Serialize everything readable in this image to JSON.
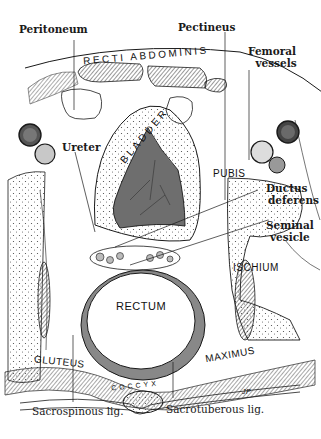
{
  "figure": {
    "colors": {
      "ink": "#1a1a1a",
      "fill_dark": "#555555",
      "fill_mid": "#8a8a8a",
      "fill_light": "#c8c8c8",
      "background": "#ffffff"
    },
    "signature": "JP"
  },
  "callouts": {
    "peritoneum": "Peritoneum",
    "pectineus": "Pectineus",
    "femoral_vessels_1": "Femoral",
    "femoral_vessels_2": "vessels",
    "ureter": "Ureter",
    "ductus_deferens_1": "Ductus",
    "ductus_deferens_2": "deferens",
    "seminal_vesicle_1": "Seminal",
    "seminal_vesicle_2": "vesicle",
    "sacrospinous": "Sacrospinous lig.",
    "sacrotuberous": "Sacrotuberous lig."
  },
  "structures": {
    "recti_abdominis": "RECTI ABDOMINIS",
    "bladder": "BLADDER",
    "pubis": "PUBIS",
    "ischium": "ISCHIUM",
    "rectum": "RECTUM",
    "gluteus": "GLUTEUS",
    "maximus": "MAXIMUS",
    "coccyx": "COCCYX"
  }
}
